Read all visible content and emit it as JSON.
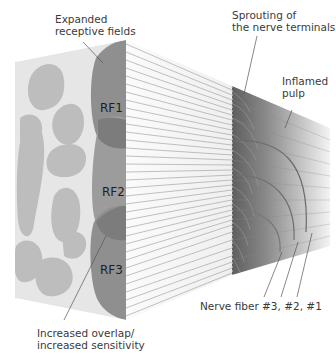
{
  "labels": {
    "expanded_fields": [
      "Expanded",
      "receptive fields"
    ],
    "sprouting": [
      "Sprouting of",
      "the nerve terminals"
    ],
    "inflamed_pulp": [
      "Inflamed",
      "pulp"
    ],
    "overlap": [
      "Increased overlap/",
      "increased sensitivity"
    ],
    "nerve_fibers": "Nerve fiber #3, #2, #1"
  },
  "receptive_fields": [
    {
      "id": "RF1",
      "label": "RF1"
    },
    {
      "id": "RF2",
      "label": "RF2"
    },
    {
      "id": "RF3",
      "label": "RF3"
    }
  ],
  "colors": {
    "skin_face": "#e6e6e6",
    "blob_light": "#b9b9b9",
    "rf_dark": "#8f8f8f",
    "fiber_line": "#9a9a9a",
    "pulp_dark": "#6e6e6e",
    "pulp_light": "#f2f2f2",
    "leader_line": "#555555",
    "text": "#3a3a3a"
  }
}
